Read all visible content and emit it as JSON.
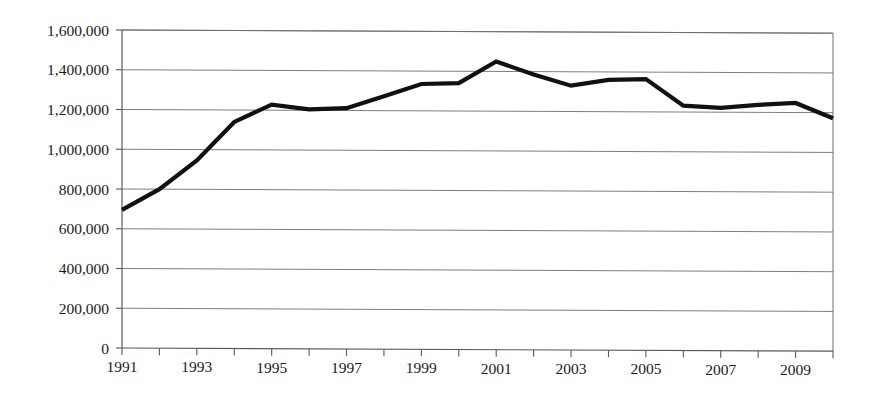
{
  "chart_data": {
    "type": "line",
    "title": "",
    "subtitle": "",
    "xlabel": "",
    "ylabel": "",
    "x": [
      1991,
      1992,
      1993,
      1994,
      1995,
      1996,
      1997,
      1998,
      1999,
      2000,
      2001,
      2002,
      2003,
      2004,
      2005,
      2006,
      2007,
      2008,
      2009,
      2010
    ],
    "values": [
      695000,
      800000,
      945000,
      1140000,
      1228000,
      1205000,
      1212000,
      1272000,
      1335000,
      1340000,
      1450000,
      1385000,
      1330000,
      1360000,
      1365000,
      1232000,
      1222000,
      1238000,
      1248000,
      1172000
    ],
    "series": [
      {
        "name": "series-1",
        "color": "#111111",
        "values": [
          695000,
          800000,
          945000,
          1140000,
          1228000,
          1205000,
          1212000,
          1272000,
          1335000,
          1340000,
          1450000,
          1385000,
          1330000,
          1360000,
          1365000,
          1232000,
          1222000,
          1238000,
          1248000,
          1172000
        ]
      }
    ],
    "xlim": [
      1991,
      2010
    ],
    "ylim": [
      0,
      1600000
    ],
    "ytick_step": 200000,
    "ytick_labels": [
      "0",
      "200,000",
      "400,000",
      "600,000",
      "800,000",
      "1,000,000",
      "1,200,000",
      "1,400,000",
      "1,600,000"
    ],
    "ytick_values": [
      0,
      200000,
      400000,
      600000,
      800000,
      1000000,
      1200000,
      1400000,
      1600000
    ],
    "xtick_values": [
      1991,
      1992,
      1993,
      1994,
      1995,
      1996,
      1997,
      1998,
      1999,
      2000,
      2001,
      2002,
      2003,
      2004,
      2005,
      2006,
      2007,
      2008,
      2009,
      2010
    ],
    "xtick_labels_shown": [
      "1991",
      "1993",
      "1995",
      "1997",
      "1999",
      "2001",
      "2003",
      "2005",
      "2007",
      "2009"
    ],
    "xtick_label_values": [
      1991,
      1993,
      1995,
      1997,
      1999,
      2001,
      2003,
      2005,
      2007,
      2009
    ],
    "grid": "horizontal",
    "legend": "none",
    "annotations": [],
    "colors": {
      "line": "#111111",
      "grid": "#6f6f6f",
      "axis": "#5a5a5a",
      "text": "#1b1b1b",
      "background": "#ffffff"
    }
  },
  "plot_area": {
    "left": 122,
    "right": 833,
    "top": 30,
    "bottom": 348
  }
}
